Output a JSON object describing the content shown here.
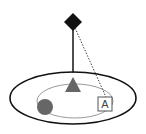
{
  "diagram": {
    "colors": {
      "background": "#ffffff",
      "diamond": "#111111",
      "line": "#222222",
      "outer_ellipse": "#111111",
      "inner_ellipse": "#999999",
      "triangle": "#666666",
      "circle": "#666666",
      "square_stroke": "#555555"
    },
    "nodes": [
      {
        "id": "diamond",
        "shape": "diamond",
        "cx": 73,
        "cy": 22
      },
      {
        "id": "triangle",
        "shape": "triangle",
        "cx": 73,
        "cy": 86
      },
      {
        "id": "circle",
        "shape": "circle",
        "cx": 45,
        "cy": 107
      },
      {
        "id": "square",
        "shape": "square",
        "cx": 105,
        "cy": 104,
        "label": "A"
      }
    ],
    "edges": [
      {
        "from": "diamond",
        "to": "outer_ellipse",
        "style": "solid"
      },
      {
        "from": "diamond",
        "to": "square",
        "style": "dotted"
      }
    ],
    "square_label": "A"
  }
}
